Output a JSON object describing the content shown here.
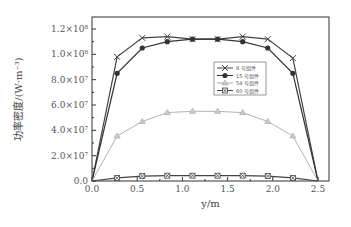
{
  "chart_data": {
    "type": "line",
    "title": "",
    "xlabel": "y/m",
    "ylabel": "功率密度/(W·m⁻³)",
    "xlim": [
      0,
      2.5
    ],
    "ylim": [
      0,
      120000000.0
    ],
    "x_ticks": [
      "0.0",
      "0.5",
      "1.0",
      "1.5",
      "2.0",
      "2.5"
    ],
    "y_ticks": [
      "0.0",
      "2.0×10⁷",
      "4.0×10⁷",
      "6.0×10⁷",
      "8.0×10⁷",
      "1.0×10⁸",
      "1.2×10⁸"
    ],
    "grid": false,
    "legend_position": "right-middle inside",
    "x": [
      0,
      0.278,
      0.556,
      0.833,
      1.111,
      1.389,
      1.667,
      1.944,
      2.222,
      2.5
    ],
    "series": [
      {
        "name": "8 号组件",
        "marker": "x",
        "color": "#444444",
        "values": [
          0,
          98000000.0,
          113000000.0,
          114000000.0,
          112000000.0,
          112000000.0,
          114000000.0,
          112000000.0,
          97000000.0,
          0
        ]
      },
      {
        "name": "15 号组件",
        "marker": "circle",
        "color": "#333333",
        "values": [
          0,
          85000000.0,
          105000000.0,
          110000000.0,
          112000000.0,
          112000000.0,
          110000000.0,
          105000000.0,
          85000000.0,
          0
        ]
      },
      {
        "name": "54 号组件",
        "marker": "triangle",
        "color": "#aaaaaa",
        "values": [
          0,
          35500000.0,
          47000000.0,
          54000000.0,
          55000000.0,
          55000000.0,
          54000000.0,
          47000000.0,
          35500000.0,
          0
        ]
      },
      {
        "name": "60 号组件",
        "marker": "asterisk-square",
        "color": "#444444",
        "values": [
          0,
          2400000.0,
          3900000.0,
          4200000.0,
          4200000.0,
          4200000.0,
          4200000.0,
          3900000.0,
          2400000.0,
          0
        ]
      }
    ]
  },
  "axis": {
    "xlabel": "y/m",
    "ylabel": "功率密度/(W·m⁻³)",
    "x_ticks": [
      "0.0",
      "0.5",
      "1.0",
      "1.5",
      "2.0",
      "2.5"
    ],
    "y_ticks": [
      "0.0",
      "2.0×10⁷",
      "4.0×10⁷",
      "6.0×10⁷",
      "8.0×10⁷",
      "1.0×10⁸",
      "1.2×10⁸"
    ]
  },
  "legend": [
    "8 号组件",
    "15 号组件",
    "54 号组件",
    "60 号组件"
  ]
}
